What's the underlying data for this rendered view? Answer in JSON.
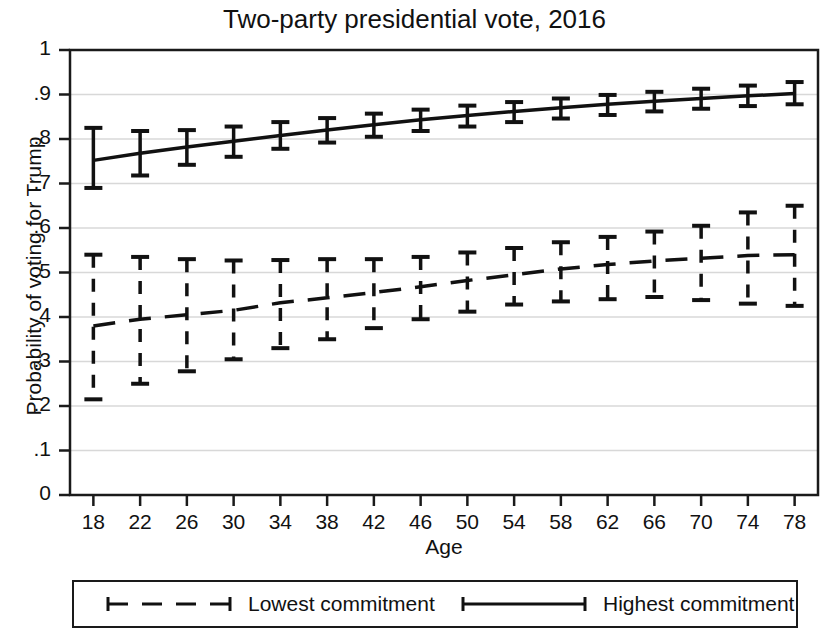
{
  "chart_data": {
    "type": "line",
    "title": "Two-party presidential vote, 2016",
    "xlabel": "Age",
    "ylabel": "Probability of voting for Trump",
    "x": [
      18,
      22,
      26,
      30,
      34,
      38,
      42,
      46,
      50,
      54,
      58,
      62,
      66,
      70,
      74,
      78
    ],
    "xlim": [
      16,
      80
    ],
    "ylim": [
      0,
      1
    ],
    "xticks": [
      18,
      22,
      26,
      30,
      34,
      38,
      42,
      46,
      50,
      54,
      58,
      62,
      66,
      70,
      74,
      78
    ],
    "xtick_labels": [
      "18",
      "22",
      "26",
      "30",
      "34",
      "38",
      "42",
      "46",
      "50",
      "54",
      "58",
      "62",
      "66",
      "70",
      "74",
      "78"
    ],
    "yticks": [
      0,
      0.1,
      0.2,
      0.3,
      0.4,
      0.5,
      0.6,
      0.7,
      0.8,
      0.9,
      1
    ],
    "ytick_labels": [
      "0",
      ".1",
      ".2",
      ".3",
      ".4",
      ".5",
      ".6",
      ".7",
      ".8",
      ".9",
      "1"
    ],
    "grid": true,
    "grid_axis": "y",
    "legend_position": "below-axes",
    "error_bars": "vertical-with-caps",
    "series": [
      {
        "name": "Lowest commitment",
        "style": "dashed",
        "color": "#111111",
        "values": [
          0.38,
          0.395,
          0.405,
          0.415,
          0.432,
          0.443,
          0.455,
          0.468,
          0.482,
          0.495,
          0.508,
          0.518,
          0.526,
          0.532,
          0.538,
          0.54
        ],
        "lower": [
          0.215,
          0.25,
          0.278,
          0.305,
          0.33,
          0.35,
          0.375,
          0.395,
          0.412,
          0.428,
          0.435,
          0.44,
          0.445,
          0.438,
          0.43,
          0.425
        ],
        "upper": [
          0.54,
          0.535,
          0.53,
          0.527,
          0.528,
          0.53,
          0.53,
          0.535,
          0.545,
          0.555,
          0.568,
          0.58,
          0.592,
          0.605,
          0.635,
          0.65
        ]
      },
      {
        "name": "Highest commitment",
        "style": "solid",
        "color": "#111111",
        "values": [
          0.752,
          0.768,
          0.782,
          0.795,
          0.808,
          0.82,
          0.832,
          0.843,
          0.853,
          0.862,
          0.87,
          0.878,
          0.885,
          0.891,
          0.897,
          0.902
        ],
        "lower": [
          0.69,
          0.718,
          0.742,
          0.76,
          0.778,
          0.792,
          0.805,
          0.818,
          0.828,
          0.838,
          0.846,
          0.854,
          0.862,
          0.868,
          0.874,
          0.878
        ],
        "upper": [
          0.825,
          0.818,
          0.82,
          0.828,
          0.838,
          0.847,
          0.857,
          0.866,
          0.875,
          0.883,
          0.891,
          0.899,
          0.906,
          0.913,
          0.92,
          0.928
        ]
      }
    ]
  },
  "legend": {
    "items": [
      {
        "label": "Lowest commitment",
        "style": "dashed"
      },
      {
        "label": "Highest commitment",
        "style": "solid"
      }
    ]
  }
}
